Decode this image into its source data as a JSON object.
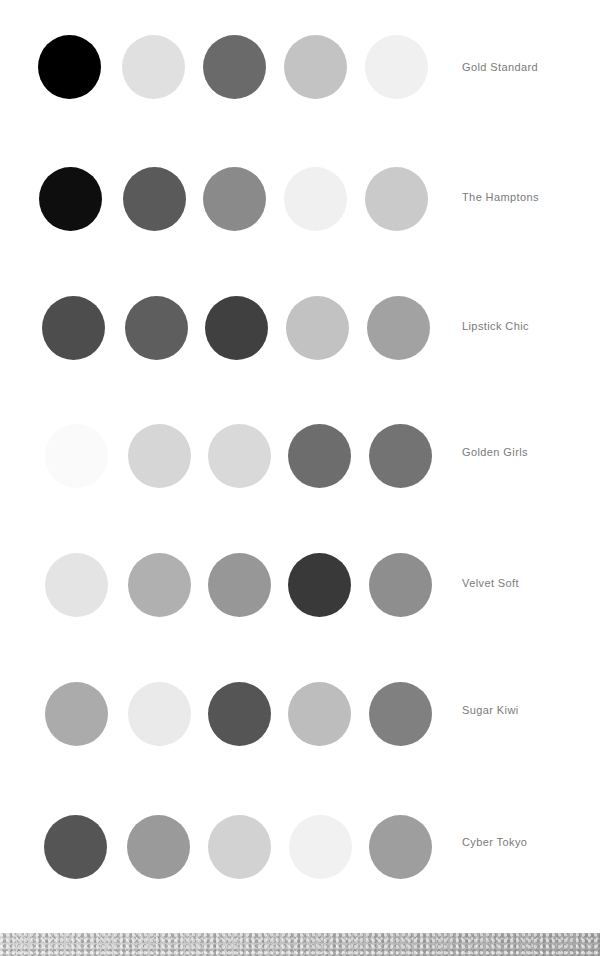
{
  "palettes": [
    {
      "name": "Gold Standard",
      "swatches": [
        "#000000",
        "#e0e0e0",
        "#6a6a6a",
        "#c3c3c3",
        "#f0f0f0"
      ]
    },
    {
      "name": "The Hamptons",
      "swatches": [
        "#0e0e0e",
        "#5a5a5a",
        "#8a8a8a",
        "#f0f0f0",
        "#cacaca"
      ]
    },
    {
      "name": "Lipstick Chic",
      "swatches": [
        "#4d4d4d",
        "#5e5e5e",
        "#404040",
        "#c2c2c2",
        "#a2a2a2"
      ]
    },
    {
      "name": "Golden Girls",
      "swatches": [
        "#fafafa",
        "#d6d6d6",
        "#d9d9d9",
        "#6d6d6d",
        "#737373"
      ]
    },
    {
      "name": "Velvet Soft",
      "swatches": [
        "#e4e4e4",
        "#b0b0b0",
        "#979797",
        "#393939",
        "#8e8e8e"
      ]
    },
    {
      "name": "Sugar Kiwi",
      "swatches": [
        "#ababab",
        "#eaeaea",
        "#555555",
        "#bdbdbd",
        "#808080"
      ]
    },
    {
      "name": "Cyber Tokyo",
      "swatches": [
        "#555555",
        "#9a9a9a",
        "#d2d2d2",
        "#f1f1f1",
        "#9e9e9e"
      ]
    }
  ]
}
